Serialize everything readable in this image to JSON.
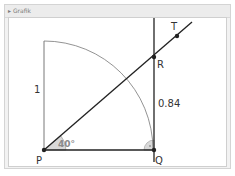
{
  "window": {
    "title": "▸ Grafik"
  },
  "diagram": {
    "points": [
      {
        "name": "P",
        "x": 44,
        "y": 150
      },
      {
        "name": "Q",
        "x": 154,
        "y": 150
      },
      {
        "name": "R",
        "x": 154,
        "y": 57
      },
      {
        "name": "T",
        "x": 177,
        "y": 36
      }
    ],
    "labels": {
      "P": "P",
      "Q": "Q",
      "R": "R",
      "T": "T",
      "radius": "1",
      "segment_QR": "0.84",
      "angle": "40°"
    },
    "angle_deg": 40,
    "radius_value": 1,
    "tangent_value": 0.84,
    "colors": {
      "line": "#222222",
      "arc": "#777777",
      "thin_line": "#555555",
      "angle_fill": "#d9d9d9",
      "angle_text": "#8a8a8a"
    }
  }
}
